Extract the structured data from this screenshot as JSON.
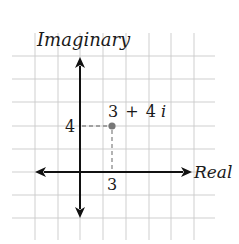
{
  "diagram": {
    "axis_labels": {
      "vertical": "Imaginary",
      "horizontal": "Real"
    },
    "tick_labels": {
      "imaginary_value": "4",
      "real_value": "3"
    },
    "point": {
      "label_real": "3",
      "label_op": "+",
      "label_imag": "4i",
      "label_full": "3 + 4i",
      "real": 3,
      "imaginary": 4
    },
    "colors": {
      "grid": "#c9c9c9",
      "axis": "#111111",
      "guide": "#8a8a8a",
      "point": "#777777"
    }
  },
  "chart_data": {
    "type": "scatter",
    "title": "",
    "xlabel": "Real",
    "ylabel": "Imaginary",
    "points": [
      {
        "x": 3,
        "y": 4,
        "label": "3 + 4i"
      }
    ],
    "xlim": [
      -3,
      6
    ],
    "ylim": [
      -2,
      5
    ],
    "grid": true
  }
}
